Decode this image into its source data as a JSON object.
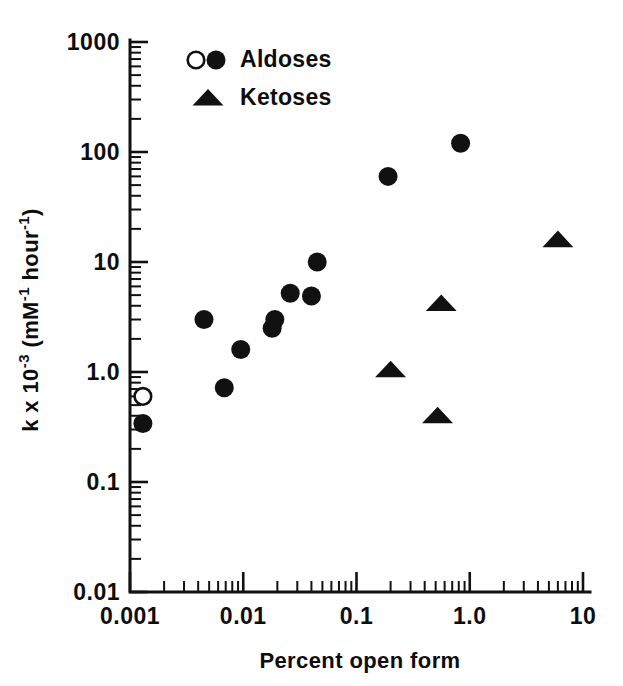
{
  "chart_data": {
    "type": "scatter",
    "title": "",
    "xlabel": "Percent open form",
    "ylabel": "k x 10-3 (mM-1 hour-1)",
    "ylabel_parts": {
      "lead": "k x 10",
      "exp1": "-3",
      "mid": " (mM",
      "exp2": "-1",
      "mid2": " hour",
      "exp3": "-1",
      "tail": ")"
    },
    "xscale": "log",
    "yscale": "log",
    "xlim": [
      0.001,
      10
    ],
    "ylim": [
      0.01,
      1000
    ],
    "grid": false,
    "legend_position": "top-left",
    "xticks": [
      {
        "value": 0.001,
        "label": "0.001"
      },
      {
        "value": 0.01,
        "label": "0.01"
      },
      {
        "value": 0.1,
        "label": "0.1"
      },
      {
        "value": 1.0,
        "label": "1.0"
      },
      {
        "value": 10,
        "label": "10"
      }
    ],
    "yticks": [
      {
        "value": 1000,
        "label": "1000"
      },
      {
        "value": 100,
        "label": "100"
      },
      {
        "value": 10,
        "label": "10"
      },
      {
        "value": 1.0,
        "label": "1.0"
      },
      {
        "value": 0.1,
        "label": "0.1"
      },
      {
        "value": 0.01,
        "label": "0.01"
      }
    ],
    "series": [
      {
        "name": "Aldoses",
        "marker": "circle-filled",
        "color": "#111111",
        "points": [
          {
            "x": 0.0013,
            "y": 0.34
          },
          {
            "x": 0.0045,
            "y": 3.0
          },
          {
            "x": 0.0068,
            "y": 0.72
          },
          {
            "x": 0.0095,
            "y": 1.6
          },
          {
            "x": 0.018,
            "y": 2.5
          },
          {
            "x": 0.019,
            "y": 3.0
          },
          {
            "x": 0.026,
            "y": 5.2
          },
          {
            "x": 0.04,
            "y": 4.9
          },
          {
            "x": 0.045,
            "y": 10.0
          },
          {
            "x": 0.19,
            "y": 60.0
          },
          {
            "x": 0.83,
            "y": 120.0
          }
        ]
      },
      {
        "name": "Aldoses (open)",
        "marker": "circle-open",
        "color": "#111111",
        "points": [
          {
            "x": 0.0013,
            "y": 0.6
          }
        ]
      },
      {
        "name": "Ketoses",
        "marker": "triangle-filled",
        "color": "#111111",
        "points": [
          {
            "x": 0.2,
            "y": 1.05
          },
          {
            "x": 0.52,
            "y": 0.4
          },
          {
            "x": 0.56,
            "y": 4.2
          },
          {
            "x": 6.0,
            "y": 16.0
          }
        ]
      }
    ],
    "legend": [
      {
        "label": "Aldoses",
        "markers": [
          "circle-open",
          "circle-filled"
        ]
      },
      {
        "label": "Ketoses",
        "markers": [
          "triangle-filled"
        ]
      }
    ]
  }
}
